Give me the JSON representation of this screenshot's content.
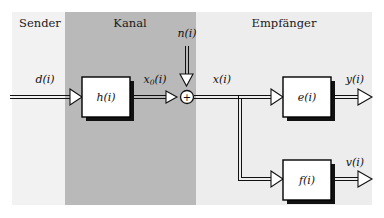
{
  "figure": {
    "type": "block-diagram",
    "title": "",
    "canvas": {
      "width": 384,
      "height": 218,
      "background": "#ffffff"
    }
  },
  "regions": [
    {
      "id": "sender",
      "label": "Sender",
      "fill": "#f2f2f2",
      "x": 12,
      "y": 12,
      "width": 53,
      "height": 193,
      "label_x": 40,
      "label_y": 24
    },
    {
      "id": "kanal",
      "label": "Kanal",
      "fill": "#b9b9b9",
      "x": 65,
      "y": 12,
      "width": 131,
      "height": 193,
      "label_x": 130,
      "label_y": 24
    },
    {
      "id": "empfaenger",
      "label": "Empfänger",
      "fill": "#ededed",
      "x": 196,
      "y": 12,
      "width": 176,
      "height": 193,
      "label_x": 284,
      "label_y": 24
    }
  ],
  "blocks": [
    {
      "id": "h",
      "label": "h(i)",
      "x": 82,
      "y": 77,
      "width": 48,
      "height": 40,
      "fill": "#ffffff",
      "stroke": "#000000",
      "shadow": "#111111"
    },
    {
      "id": "e",
      "label": "e(i)",
      "x": 283,
      "y": 77,
      "width": 48,
      "height": 40,
      "fill": "#ffffff",
      "stroke": "#000000",
      "shadow": "#111111"
    },
    {
      "id": "f",
      "label": "f(i)",
      "x": 283,
      "y": 160,
      "width": 48,
      "height": 40,
      "fill": "#ffffff",
      "stroke": "#000000",
      "shadow": "#111111"
    }
  ],
  "nodes": [
    {
      "id": "adder",
      "glyph": "+",
      "cx": 187,
      "cy": 97,
      "r": 6.5,
      "fill": "#ffffff",
      "stroke": "#111111"
    }
  ],
  "signals": [
    {
      "id": "d",
      "label": "d(i)",
      "base": "d",
      "sub": "",
      "x": 45,
      "y": 80
    },
    {
      "id": "x0",
      "label": "x0(i)",
      "base": "x",
      "sub": "0",
      "x": 155,
      "y": 80
    },
    {
      "id": "n",
      "label": "n(i)",
      "base": "n",
      "sub": "",
      "x": 187,
      "y": 34
    },
    {
      "id": "x",
      "label": "x(i)",
      "base": "x",
      "sub": "",
      "x": 222,
      "y": 80
    },
    {
      "id": "y",
      "label": "y(i)",
      "base": "y",
      "sub": "",
      "x": 355,
      "y": 80
    },
    {
      "id": "v",
      "label": "v(i)",
      "base": "v",
      "sub": "",
      "x": 355,
      "y": 163
    }
  ],
  "connections": [
    {
      "id": "d-to-h",
      "from": "input",
      "to": "h",
      "orientation": "horizontal"
    },
    {
      "id": "h-to-adder",
      "from": "h",
      "to": "adder",
      "orientation": "horizontal"
    },
    {
      "id": "n-to-adder",
      "from": "noise",
      "to": "adder",
      "orientation": "vertical"
    },
    {
      "id": "adder-to-e",
      "from": "adder",
      "to": "e",
      "orientation": "horizontal"
    },
    {
      "id": "branch-to-f",
      "from": "adder",
      "to": "f",
      "orientation": "branch"
    },
    {
      "id": "e-to-y",
      "from": "e",
      "to": "output",
      "orientation": "horizontal"
    },
    {
      "id": "f-to-v",
      "from": "f",
      "to": "output",
      "orientation": "horizontal"
    }
  ],
  "style": {
    "line_color": "#111111",
    "arrow_fill": "#ffffff",
    "double_line_gap": 3
  }
}
